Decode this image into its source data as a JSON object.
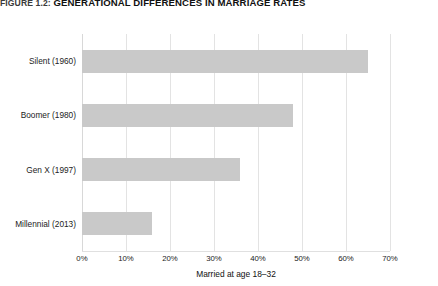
{
  "figure": {
    "number_label": "FIGURE 1.2:",
    "title": "GENERATIONAL DIFFERENCES IN MARRIAGE RATES"
  },
  "chart_data": {
    "type": "bar",
    "orientation": "horizontal",
    "title": "FIGURE 1.2: GENERATIONAL DIFFERENCES IN MARRIAGE RATES",
    "categories": [
      "Silent (1960)",
      "Boomer (1980)",
      "Gen X (1997)",
      "Millennial (2013)"
    ],
    "values": [
      65,
      48,
      36,
      16
    ],
    "value_unit": "%",
    "xlabel": "Married at age 18–32",
    "ylabel": "",
    "xlim": [
      0,
      70
    ],
    "xticks": [
      0,
      10,
      20,
      30,
      40,
      50,
      60,
      70
    ],
    "xtick_labels": [
      "0%",
      "10%",
      "20%",
      "30%",
      "40%",
      "50%",
      "60%",
      "70%"
    ],
    "grid": true,
    "grid_axis": "x",
    "legend": false,
    "bar_color": "#c9c9c9",
    "grid_color": "#e3e3e3",
    "background_color": "#ffffff"
  }
}
